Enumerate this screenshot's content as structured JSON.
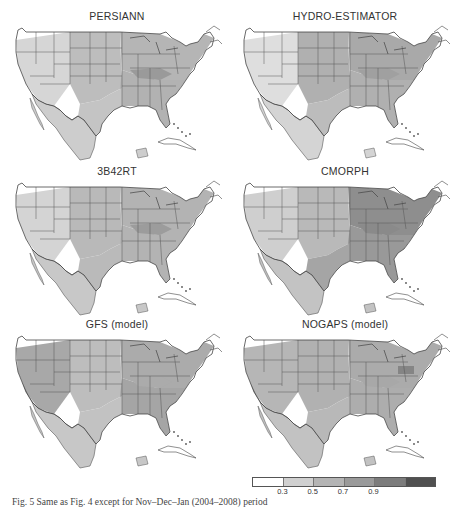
{
  "figure": {
    "caption": "Fig. 5  Same as Fig. 4 except for Nov–Dec–Jan (2004–2008) period"
  },
  "panels": [
    {
      "title": "PERSIANN",
      "shade": {
        "west": "#d6d6d6",
        "plains": "#bdbdbd",
        "east": "#b5b5b5",
        "southeast": "#b2b2b2",
        "texas": "#c4c4c4",
        "mexico": "#cdcdcd",
        "ohio_valley": "#9a9a9a"
      }
    },
    {
      "title": "HYDRO-ESTIMATOR",
      "shade": {
        "west": "#dedede",
        "plains": "#b0b0b0",
        "east": "#a9a9a9",
        "southeast": "#b0b0b0",
        "texas": "#bcbcbc",
        "mexico": "#d4d4d4",
        "ohio_valley": "#a0a0a0"
      }
    },
    {
      "title": "3B42RT",
      "shade": {
        "west": "#d4d4d4",
        "plains": "#b9b9b9",
        "east": "#b3b3b3",
        "southeast": "#b3b3b3",
        "texas": "#bababa",
        "mexico": "#c8c8c8",
        "ohio_valley": "#9c9c9c"
      }
    },
    {
      "title": "CMORPH",
      "shade": {
        "west": "#cfcfcf",
        "plains": "#b9b9b9",
        "east": "#8e8e8e",
        "southeast": "#999999",
        "texas": "#a5a5a5",
        "mexico": "#c3c3c3",
        "ohio_valley": "#8a8a8a"
      }
    },
    {
      "title": "GFS (model)",
      "shade": {
        "west": "#a8a8a8",
        "plains": "#bdbdbd",
        "east": "#ababab",
        "southeast": "#a5a5a5",
        "texas": "#c2c2c2",
        "mexico": "#c7c7c7",
        "ohio_valley": "#ababab"
      }
    },
    {
      "title": "NOGAPS (model)",
      "shade": {
        "west": "#b6b6b6",
        "plains": "#b1b1b1",
        "east": "#ababab",
        "southeast": "#adadad",
        "texas": "#b8b8b8",
        "mexico": "#c2c2c2",
        "ohio_valley": "#a8a8a8"
      }
    }
  ],
  "colorbar": {
    "segments": [
      "#ffffff",
      "#d0d0d0",
      "#b4b4b4",
      "#9a9a9a",
      "#7c7c7c",
      "#505050"
    ],
    "ticks": [
      "0.3",
      "0.5",
      "0.7",
      "0.9"
    ]
  },
  "chart_data": {
    "type": "heatmap",
    "title": "",
    "panels": [
      "PERSIANN",
      "HYDRO-ESTIMATOR",
      "3B42RT",
      "CMORPH",
      "GFS (model)",
      "NOGAPS (model)"
    ],
    "layout": {
      "rows": 3,
      "cols": 2
    },
    "colorbar": {
      "bins": [
        "<0.3",
        "0.3–0.5",
        "0.5–0.7",
        "0.7–0.9",
        ">0.9"
      ],
      "ticks": [
        0.3,
        0.5,
        0.7,
        0.9
      ],
      "position": "bottom-right"
    },
    "regional_estimates": {
      "PERSIANN": {
        "west": "0.3–0.5",
        "plains": "0.5–0.7",
        "east": "0.5–0.7",
        "ohio_valley": "0.7–0.9",
        "mexico": "0.3–0.5"
      },
      "HYDRO-ESTIMATOR": {
        "west": "<0.3–0.5",
        "plains": "0.5–0.7",
        "east": "0.5–0.7",
        "ohio_valley": "0.7",
        "mexico": "0.3–0.5"
      },
      "3B42RT": {
        "west": "0.3–0.5",
        "plains": "0.5–0.7",
        "east": "0.5–0.7",
        "ohio_valley": "0.7–0.9",
        "mexico": "0.3–0.5"
      },
      "CMORPH": {
        "west": "0.3–0.5",
        "plains": "0.5",
        "east": "0.7–0.9",
        "ohio_valley": "0.7–0.9",
        "mexico": "0.5"
      },
      "GFS (model)": {
        "west": "0.5–0.7",
        "plains": "0.5",
        "east": "0.5–0.7",
        "california_coast": "0.7–0.9",
        "desert_southwest": "<0.3",
        "mexico": "0.5"
      },
      "NOGAPS (model)": {
        "west": "0.5",
        "plains": "0.5–0.7",
        "east": "0.5–0.7",
        "pennsylvania": "0.7–0.9",
        "california_coast": "0.7–0.9",
        "mexico": "0.5"
      }
    }
  }
}
